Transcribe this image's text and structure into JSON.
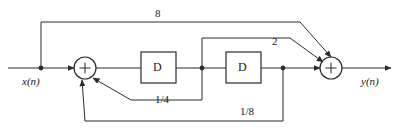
{
  "diagram": {
    "canvas": {
      "width": 399,
      "height": 132,
      "background": "#ffffff"
    },
    "stroke_color": "#2b2b2b",
    "signals": {
      "input_label": "x(n)",
      "output_label": "y(n)"
    },
    "blocks": [
      {
        "id": "delay-1",
        "label": "D",
        "x": 141,
        "y": 52,
        "w": 35,
        "h": 31
      },
      {
        "id": "delay-2",
        "label": "D",
        "x": 226,
        "y": 52,
        "w": 35,
        "h": 31
      }
    ],
    "adders": [
      {
        "id": "adder-left",
        "label": "+",
        "cx": 85,
        "cy": 68,
        "r": 11
      },
      {
        "id": "adder-right",
        "label": "+",
        "cx": 331,
        "cy": 68,
        "r": 11
      }
    ],
    "gains": [
      {
        "id": "gain-8",
        "label": "8",
        "x": 155,
        "y": 8
      },
      {
        "id": "gain-2",
        "label": "2",
        "x": 272,
        "y": 36
      },
      {
        "id": "gain-quarter",
        "label": "1/4",
        "x": 155,
        "y": 94
      },
      {
        "id": "gain-eighth",
        "label": "1/8",
        "x": 240,
        "y": 106
      }
    ],
    "junctions": [
      {
        "id": "tap-input",
        "cx": 41,
        "cy": 68
      },
      {
        "id": "tap-after-delay-1",
        "cx": 202,
        "cy": 68
      },
      {
        "id": "tap-after-delay-2",
        "cx": 283,
        "cy": 68
      }
    ]
  }
}
